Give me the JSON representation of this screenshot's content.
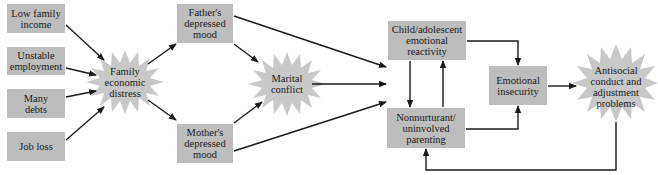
{
  "diagram": {
    "colors": {
      "box_fill": "#bdbdbd",
      "star_fill": "#c8c8c8",
      "arrow": "#1a1a1a",
      "background": "#ffffff"
    },
    "nodes": {
      "low_income": {
        "label_1": "Low family",
        "label_2": "income",
        "shape": "box"
      },
      "unstable_employment": {
        "label_1": "Unstable",
        "label_2": "employment",
        "shape": "box"
      },
      "many_debts": {
        "label_1": "Many",
        "label_2": "debts",
        "shape": "box"
      },
      "job_loss": {
        "label_1": "Job loss",
        "shape": "box"
      },
      "family_distress": {
        "label_1": "Family",
        "label_2": "economic",
        "label_3": "distress",
        "shape": "starburst"
      },
      "father_mood": {
        "label_1": "Father's",
        "label_2": "depressed",
        "label_3": "mood",
        "shape": "box"
      },
      "mother_mood": {
        "label_1": "Mother's",
        "label_2": "depressed",
        "label_3": "mood",
        "shape": "box"
      },
      "marital_conflict": {
        "label_1": "Marital",
        "label_2": "conflict",
        "shape": "starburst"
      },
      "child_reactivity": {
        "label_1": "Child/adolescent",
        "label_2": "emotional",
        "label_3": "reactivity",
        "shape": "box"
      },
      "nonnurturant": {
        "label_1": "Nonnurturant/",
        "label_2": "uninvolved",
        "label_3": "parenting",
        "shape": "box"
      },
      "emotional_insecurity": {
        "label_1": "Emotional",
        "label_2": "insecurity",
        "shape": "box"
      },
      "antisocial": {
        "label_1": "Antisocial",
        "label_2": "conduct and",
        "label_3": "adjustment",
        "label_4": "problems",
        "shape": "starburst"
      }
    },
    "edges": [
      {
        "from": "Low family income",
        "to": "Family economic distress"
      },
      {
        "from": "Unstable employment",
        "to": "Family economic distress"
      },
      {
        "from": "Many debts",
        "to": "Family economic distress"
      },
      {
        "from": "Job loss",
        "to": "Family economic distress"
      },
      {
        "from": "Family economic distress",
        "to": "Father's depressed mood"
      },
      {
        "from": "Family economic distress",
        "to": "Mother's depressed mood"
      },
      {
        "from": "Father's depressed mood",
        "to": "Marital conflict"
      },
      {
        "from": "Mother's depressed mood",
        "to": "Marital conflict"
      },
      {
        "from": "Father's depressed mood",
        "to": "Child/adolescent emotional reactivity / Nonnurturant parenting"
      },
      {
        "from": "Marital conflict",
        "to": "Child/adolescent emotional reactivity / Nonnurturant parenting"
      },
      {
        "from": "Mother's depressed mood",
        "to": "Child/adolescent emotional reactivity / Nonnurturant parenting"
      },
      {
        "from": "Child/adolescent emotional reactivity",
        "to": "Nonnurturant/uninvolved parenting"
      },
      {
        "from": "Nonnurturant/uninvolved parenting",
        "to": "Child/adolescent emotional reactivity"
      },
      {
        "from": "Child/adolescent emotional reactivity",
        "to": "Emotional insecurity"
      },
      {
        "from": "Nonnurturant/uninvolved parenting",
        "to": "Emotional insecurity"
      },
      {
        "from": "Emotional insecurity",
        "to": "Antisocial conduct and adjustment problems"
      },
      {
        "from": "Antisocial conduct and adjustment problems",
        "to": "Nonnurturant/uninvolved parenting"
      }
    ]
  }
}
